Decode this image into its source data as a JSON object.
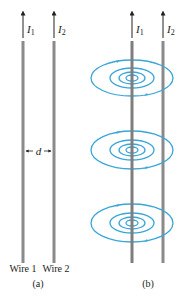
{
  "colors": {
    "wire": "#8a8a8a",
    "wire_dark": "#6e6e6e",
    "field": "#3aa6d8",
    "text": "#222222"
  },
  "panel_a": {
    "current_1": "I",
    "current_1_sub": "1",
    "current_2": "I",
    "current_2_sub": "2",
    "separation_label": "d",
    "wire_1_label": "Wire 1",
    "wire_2_label": "Wire 2",
    "caption": "(a)"
  },
  "panel_b": {
    "current_1": "I",
    "current_1_sub": "1",
    "current_2": "I",
    "current_2_sub": "2",
    "field_loop_groups": 3,
    "caption": "(b)"
  }
}
